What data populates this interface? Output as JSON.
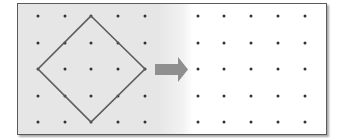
{
  "figure": {
    "colors": {
      "left_panel_bg": "#e6e6e6",
      "right_panel_bg": "#ffffff",
      "frame_border": "#5a5a5a",
      "dot": "#333333",
      "shape_stroke": "#5c5c5c",
      "arrow_fill": "#8f8f8f"
    },
    "left_grid": {
      "rows": 5,
      "cols": 5,
      "x": [
        38,
        65,
        91,
        118,
        145
      ],
      "y": [
        16,
        43,
        69,
        96,
        122
      ]
    },
    "diamond": {
      "vertices": [
        [
          91,
          16
        ],
        [
          145,
          69
        ],
        [
          91,
          122
        ],
        [
          38,
          69
        ]
      ]
    },
    "arrow": {
      "direction": "right",
      "body": {
        "x": 155,
        "y": 64,
        "w": 23,
        "h": 11
      },
      "head": [
        [
          178,
          57
        ],
        [
          188,
          69.5
        ],
        [
          178,
          82
        ]
      ]
    },
    "right_grid": {
      "rows": 5,
      "cols": 5,
      "x": [
        198,
        224,
        251,
        278,
        305
      ],
      "y": [
        16,
        43,
        69,
        96,
        122
      ]
    }
  }
}
